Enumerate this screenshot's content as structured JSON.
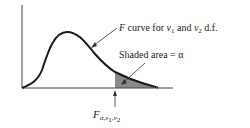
{
  "figure": {
    "curve_label": {
      "prefix": "F",
      "middle": " curve for ",
      "nu1": "ν",
      "nu1_sub": "1",
      "and": " and ",
      "nu2": "ν",
      "nu2_sub": "2",
      "suffix": " d.f."
    },
    "area_label": "Shaded area = α",
    "critical_value": {
      "symbol": "F",
      "subscript": "α,ν1,ν2",
      "sub_parts": [
        "α",
        ",ν",
        "1",
        ",ν",
        "2"
      ]
    },
    "colors": {
      "curve": "#1a1a1a",
      "axis": "#444444",
      "shade": "#8a8a8a",
      "arrow": "#333333"
    }
  }
}
